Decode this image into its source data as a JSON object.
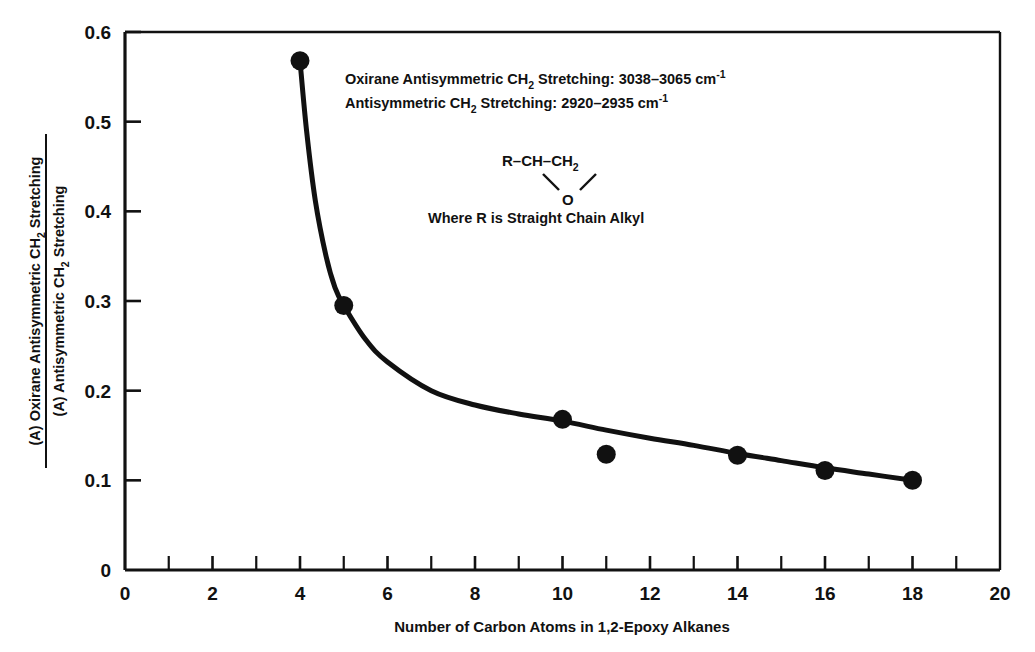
{
  "chart_data": {
    "type": "scatter",
    "title": "",
    "xlabel": "Number of Carbon Atoms in 1,2-Epoxy Alkanes",
    "ylabel_numerator": "(A) Oxirane Antisymmetric CH2 Stretching",
    "ylabel_denominator": "(A) Antisymmetric CH2 Stretching",
    "xlim": [
      0,
      20
    ],
    "ylim": [
      0,
      0.6
    ],
    "x_ticks_major": [
      0,
      2,
      4,
      6,
      8,
      10,
      12,
      14,
      16,
      18,
      20
    ],
    "x_tick_labels": [
      "0",
      "2",
      "4",
      "6",
      "8",
      "10",
      "12",
      "14",
      "16",
      "18",
      "20"
    ],
    "x_ticks_minor_step": 1,
    "y_ticks_major": [
      0,
      0.1,
      0.2,
      0.3,
      0.4,
      0.5,
      0.6
    ],
    "y_tick_labels": [
      "0",
      "0.1",
      "0.2",
      "0.3",
      "0.4",
      "0.5",
      "0.6"
    ],
    "grid": false,
    "legend": "none",
    "marker_color": "#111111",
    "line_color": "#111111",
    "x": [
      4,
      5,
      10,
      11,
      14,
      16,
      18
    ],
    "values": [
      0.568,
      0.295,
      0.168,
      0.129,
      0.128,
      0.111,
      0.1
    ],
    "points": [
      {
        "x": 4,
        "y": 0.568
      },
      {
        "x": 5,
        "y": 0.295
      },
      {
        "x": 10,
        "y": 0.168
      },
      {
        "x": 11,
        "y": 0.129
      },
      {
        "x": 14,
        "y": 0.128
      },
      {
        "x": 16,
        "y": 0.111
      },
      {
        "x": 18,
        "y": 0.1
      }
    ],
    "fit_curve": [
      {
        "x": 4,
        "y": 0.568
      },
      {
        "x": 4.15,
        "y": 0.49
      },
      {
        "x": 4.35,
        "y": 0.412
      },
      {
        "x": 4.6,
        "y": 0.349
      },
      {
        "x": 4.8,
        "y": 0.315
      },
      {
        "x": 5,
        "y": 0.295
      },
      {
        "x": 5.5,
        "y": 0.257
      },
      {
        "x": 6,
        "y": 0.232
      },
      {
        "x": 7,
        "y": 0.2
      },
      {
        "x": 8,
        "y": 0.184
      },
      {
        "x": 9,
        "y": 0.174
      },
      {
        "x": 10,
        "y": 0.166
      },
      {
        "x": 11,
        "y": 0.156
      },
      {
        "x": 12,
        "y": 0.147
      },
      {
        "x": 13,
        "y": 0.139
      },
      {
        "x": 14,
        "y": 0.13
      },
      {
        "x": 15,
        "y": 0.122
      },
      {
        "x": 16,
        "y": 0.114
      },
      {
        "x": 17,
        "y": 0.107
      },
      {
        "x": 18,
        "y": 0.1
      }
    ]
  },
  "annotations": {
    "line1_a": "Oxirane Antisymmetric CH",
    "line1_sub": "2",
    "line1_b": " Stretching: 3038–3065 cm",
    "line1_sup": "-1",
    "line2_a": "Antisymmetric CH",
    "line2_sub": "2",
    "line2_b": " Stretching: 2920–2935 cm",
    "line2_sup": "-1",
    "structure_top_a": "R–CH–CH",
    "structure_top_sub": "2",
    "structure_oxygen": "O",
    "note": "Where R is Straight Chain Alkyl"
  },
  "ylabel": {
    "num_a": "(A) Oxirane Antisymmetric CH",
    "num_sub": "2",
    "num_b": " Stretching",
    "den_a": "(A) Antisymmetric CH",
    "den_sub": "2",
    "den_b": " Stretching"
  },
  "xlabel": {
    "text": "Number of Carbon Atoms in 1,2-Epoxy Alkanes"
  }
}
